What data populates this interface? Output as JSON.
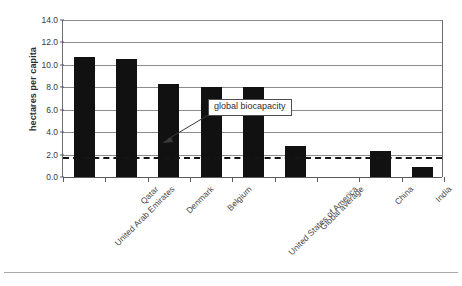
{
  "chart_data": {
    "type": "bar",
    "title": "",
    "subtitle": "",
    "xlabel": "",
    "ylabel": "hectares per capita",
    "ylim": [
      0.0,
      14.0
    ],
    "ytick_labels": [
      "0.0",
      "2.0",
      "4.0",
      "6.0",
      "8.0",
      "10.0",
      "12.0",
      "14.0"
    ],
    "ytick_values": [
      0.0,
      2.0,
      4.0,
      6.0,
      8.0,
      10.0,
      12.0,
      14.0
    ],
    "grid": "horizontal",
    "legend": "none",
    "categories": [
      "United Arab Emirates",
      "Qatar",
      "Denmark",
      "Belgium",
      "United States of America",
      "Global average",
      "",
      "China",
      "India"
    ],
    "values": [
      10.7,
      10.5,
      8.3,
      8.0,
      8.0,
      2.8,
      null,
      2.3,
      0.9
    ],
    "bar_color": "#111111",
    "annotations": [
      {
        "text": "global biocapacity",
        "target_value": 1.8,
        "type": "dashed-reference-line"
      }
    ],
    "reference_line": {
      "label": "global biocapacity",
      "value": 1.8,
      "style": "dashed",
      "color": "#141414"
    }
  }
}
